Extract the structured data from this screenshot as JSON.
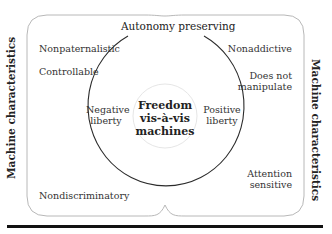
{
  "diagram": {
    "title_top": "Autonomy preserving",
    "center": {
      "line1": "Freedom",
      "line2": "vis-à-vis",
      "line3": "machines"
    },
    "side_labels": {
      "left": "Machine characteristics",
      "right": "Machine characteristics"
    },
    "inner_labels": {
      "left": [
        "Negative",
        "liberty"
      ],
      "right": [
        "Positive",
        "liberty"
      ]
    },
    "left_panel_items": [
      "Nonpaternalistic",
      "Controllable",
      "Nondiscriminatory"
    ],
    "right_panel_items": [
      {
        "lines": [
          "Nonaddictive"
        ]
      },
      {
        "lines": [
          "Does not",
          "manipulate"
        ]
      },
      {
        "lines": [
          "Attention",
          "sensitive"
        ]
      }
    ],
    "colors": {
      "frame": "#b8b8b8",
      "circle": "#2b2b2b",
      "inner_circle": "#e6e6e6",
      "rule": "#111111"
    }
  }
}
